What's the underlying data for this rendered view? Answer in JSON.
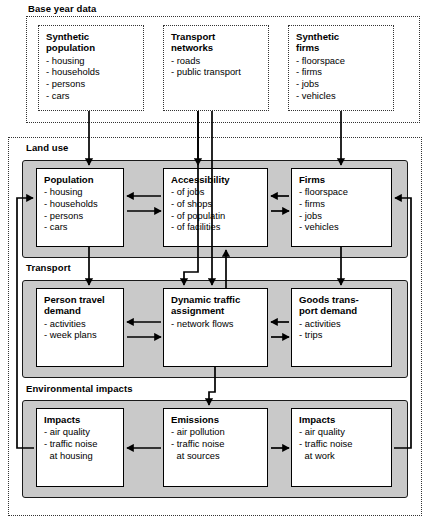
{
  "diagram": {
    "groups": [
      {
        "id": "base-year-data",
        "label": "Base year data"
      },
      {
        "id": "land-use",
        "label": "Land use"
      },
      {
        "id": "transport",
        "label": "Transport"
      },
      {
        "id": "environmental-impacts",
        "label": "Environmental impacts"
      }
    ],
    "nodes": {
      "synthetic_population": {
        "title": "Synthetic\npopulation",
        "items": [
          "- housing",
          "- households",
          "- persons",
          "- cars"
        ]
      },
      "transport_networks": {
        "title": "Transport\nnetworks",
        "items": [
          "- roads",
          "- public transport"
        ]
      },
      "synthetic_firms": {
        "title": "Synthetic\nfirms",
        "items": [
          "- floorspace",
          "- firms",
          "- jobs",
          "- vehicles"
        ]
      },
      "population": {
        "title": "Population",
        "items": [
          "- housing",
          "- households",
          "- persons",
          "- cars"
        ]
      },
      "accessibility": {
        "title": "Accessibility",
        "items": [
          "- of jobs",
          "- of shops",
          "- of populatin",
          "- of facilities"
        ]
      },
      "firms": {
        "title": "Firms",
        "items": [
          "- floorspace",
          "- firms",
          "- jobs",
          "- vehicles"
        ]
      },
      "person_travel_demand": {
        "title": "Person travel\ndemand",
        "items": [
          "- activities",
          "- week plans"
        ]
      },
      "dynamic_traffic_assignment": {
        "title": "Dynamic traffic\nassignment",
        "items": [
          "- network flows"
        ]
      },
      "goods_transport_demand": {
        "title": "Goods trans-\nport demand",
        "items": [
          "- activities",
          "- trips"
        ]
      },
      "impacts_housing": {
        "title": "Impacts",
        "items": [
          "- air quality",
          "- traffic noise",
          "   at housing"
        ]
      },
      "emissions": {
        "title": "Emissions",
        "items": [
          "- air pollution",
          "- traffic noise",
          "   at sources"
        ]
      },
      "impacts_work": {
        "title": "Impacts",
        "items": [
          "- air quality",
          "- traffic noise",
          "   at work"
        ]
      }
    },
    "colors": {
      "band_fill": "#c9c9c9",
      "node_fill": "#ffffff",
      "stroke": "#000000",
      "dotted_stroke": "#333333",
      "page_background": "#ffffff"
    }
  }
}
